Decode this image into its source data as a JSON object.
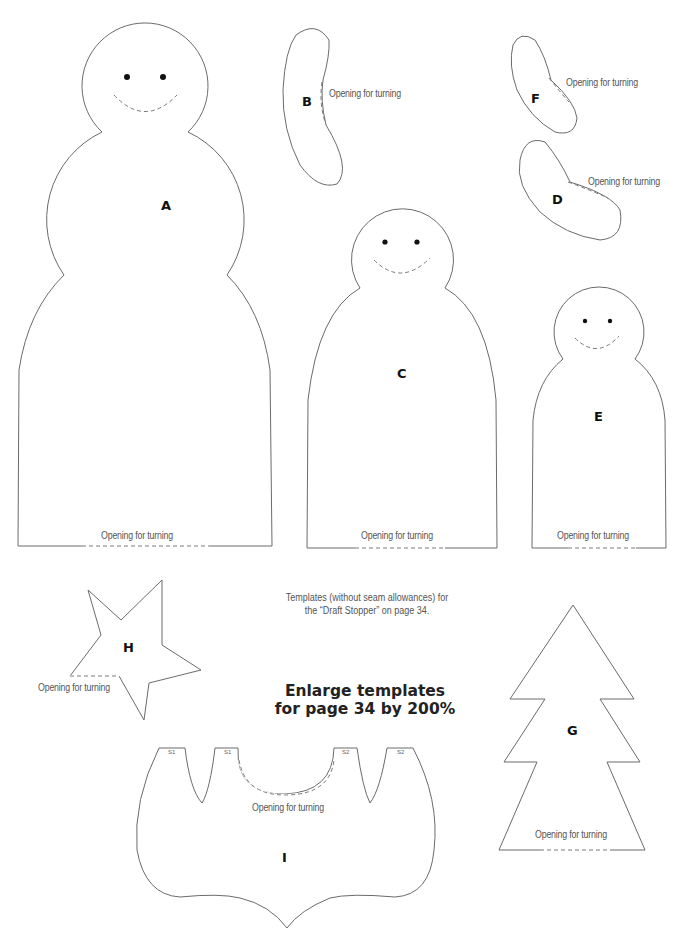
{
  "document": {
    "caption_line1": "Templates (without seam allowances) for",
    "caption_line2": "the “Draft Stopper” on page 34.",
    "headline_line1": "Enlarge templates",
    "headline_line2": "for page 34 by 200%"
  },
  "templates": {
    "A": {
      "label": "A",
      "note": "Opening for turning"
    },
    "B": {
      "label": "B",
      "note": "Opening for turning"
    },
    "C": {
      "label": "C",
      "note": "Opening for turning"
    },
    "D": {
      "label": "D",
      "note": "Opening for turning"
    },
    "E": {
      "label": "E",
      "note": "Opening for turning"
    },
    "F": {
      "label": "F",
      "note": "Opening for turning"
    },
    "G": {
      "label": "G",
      "note": "Opening for turning"
    },
    "H": {
      "label": "H",
      "note": "Opening for turning"
    },
    "I": {
      "label": "I",
      "note": "Opening for turning",
      "seams": [
        "S1",
        "S1",
        "S2",
        "S2"
      ]
    }
  },
  "colors": {
    "outline": "#6b6b6b",
    "text": "#555555",
    "label": "#111111"
  }
}
